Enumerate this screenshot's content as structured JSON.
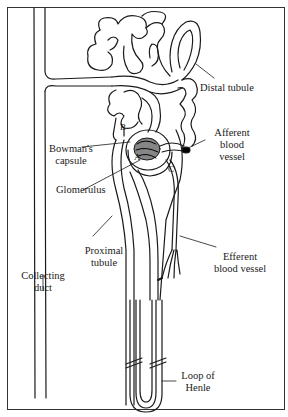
{
  "diagram": {
    "line_color": "#1a1a1a",
    "labels": {
      "distal_tubule": "Distal tubule",
      "afferent_vessel": [
        "Afferent",
        "blood",
        "vessel"
      ],
      "bowmans_capsule": [
        "Bowman's",
        "capsule"
      ],
      "glomerulus": "Glomerulus",
      "proximal_tubule": [
        "Proximal",
        "tubule"
      ],
      "collecting_duct": [
        "Collecting",
        "duct"
      ],
      "efferent_vessel": [
        "Efferent",
        "blood vessel"
      ],
      "loop_of_henle": [
        "Loop of",
        "Henle"
      ]
    },
    "letters": {
      "a": "A",
      "b": "B",
      "c": "C"
    }
  }
}
